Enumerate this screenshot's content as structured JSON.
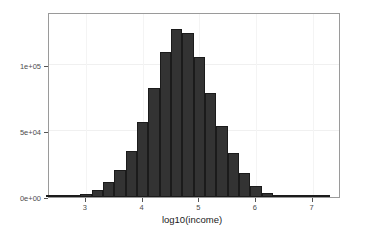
{
  "chart_data": {
    "type": "bar",
    "title": "",
    "subtitle": "",
    "xlabel": "log10(income)",
    "ylabel": "",
    "xlim": [
      2.35,
      7.5
    ],
    "ylim": [
      0,
      140000
    ],
    "grid": true,
    "legend": null,
    "bin_width": 0.2,
    "xticks": [
      3,
      4,
      5,
      6,
      7
    ],
    "xtick_labels": [
      "3",
      "4",
      "5",
      "6",
      "7"
    ],
    "yticks": [
      0,
      50000,
      100000
    ],
    "ytick_labels": [
      "0e+00",
      "5e+04",
      "1e+05"
    ],
    "bar_color": "#333333",
    "bar_edge_color": "#1b1b1b",
    "panel_border_color": "#9a9a9a",
    "grid_color": "#f0f0f0",
    "categories": [
      "2.4",
      "2.6",
      "2.8",
      "3.0",
      "3.2",
      "3.4",
      "3.6",
      "3.8",
      "4.0",
      "4.2",
      "4.4",
      "4.6",
      "4.8",
      "5.0",
      "5.2",
      "5.4",
      "5.6",
      "5.8",
      "6.0",
      "6.2",
      "6.4",
      "6.6",
      "6.8",
      "7.0",
      "7.2"
    ],
    "bin_centers": [
      2.4,
      2.6,
      2.8,
      3.0,
      3.2,
      3.4,
      3.6,
      3.8,
      4.0,
      4.2,
      4.4,
      4.6,
      4.8,
      5.0,
      5.2,
      5.4,
      5.6,
      5.8,
      6.0,
      6.2,
      6.4,
      6.6,
      6.8,
      7.0,
      7.2
    ],
    "values": [
      200,
      400,
      900,
      2200,
      5500,
      11500,
      20500,
      34500,
      56500,
      82500,
      110000,
      127000,
      124000,
      106000,
      79000,
      53500,
      33000,
      18000,
      8500,
      3000,
      900,
      300,
      150,
      80,
      40
    ]
  },
  "axis": {
    "x_title": "log10(income)"
  }
}
